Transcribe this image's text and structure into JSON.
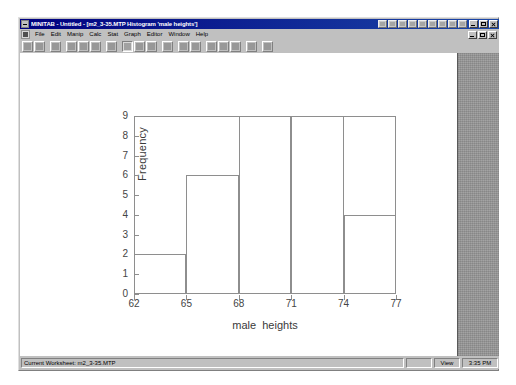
{
  "window": {
    "title": "MINITAB - Untitled - [m2_3-35.MTP Histogram 'male heights']",
    "sysmenu_icon": "minitab-system-icon",
    "buttons": {
      "minimize": "minimize-icon",
      "maximize": "maximize-icon",
      "close": "close-icon"
    }
  },
  "menubar": {
    "child_sysmenu_icon": "document-system-icon",
    "items": [
      {
        "label": "File"
      },
      {
        "label": "Edit"
      },
      {
        "label": "Manip"
      },
      {
        "label": "Calc"
      },
      {
        "label": "Stat"
      },
      {
        "label": "Graph"
      },
      {
        "label": "Editor"
      },
      {
        "label": "Window"
      },
      {
        "label": "Help"
      }
    ],
    "child_buttons": {
      "minimize": "child-minimize-icon",
      "restore": "child-restore-icon",
      "close": "child-close-icon"
    }
  },
  "toolbar": {
    "groups": [
      [
        "new-worksheet-icon",
        "open-worksheet-icon"
      ],
      [
        "print-icon"
      ],
      [
        "cut-icon",
        "copy-icon",
        "paste-icon"
      ],
      [
        "undo-icon"
      ],
      [
        "select-cursor-icon",
        "edit-last-dialog-icon",
        "brush-icon"
      ],
      [
        "session-window-icon"
      ],
      [
        "current-worksheet-icon",
        "project-manager-icon"
      ],
      [
        "show-worksheets-icon",
        "show-graphs-icon",
        "show-info-icon"
      ],
      [
        "cancel-icon"
      ],
      [
        "help-pointer-icon"
      ]
    ]
  },
  "statusbar": {
    "worksheet": "Current Worksheet: m2_3-35.MTP",
    "view": "View",
    "time": "3:35 PM"
  },
  "chart_data": {
    "type": "bar",
    "title": "",
    "subtitle": "",
    "xlabel": "male  heights",
    "ylabel": "Frequency",
    "categories": [
      "62-65",
      "65-68",
      "68-71",
      "71-74",
      "74-77"
    ],
    "bin_edges": [
      62,
      65,
      68,
      71,
      74,
      77
    ],
    "values": [
      2,
      6,
      9,
      9,
      4
    ],
    "xticks": [
      62,
      65,
      68,
      71,
      74,
      77
    ],
    "yticks": [
      0,
      1,
      2,
      3,
      4,
      5,
      6,
      7,
      8,
      9
    ],
    "xlim": [
      62,
      77
    ],
    "ylim": [
      0,
      9
    ],
    "grid": false,
    "legend": false,
    "bar_fill": "none",
    "bar_edge_color": "#8e8e8e",
    "axis_color": "#8e8e8e",
    "text_color": "#3a3a3a"
  }
}
